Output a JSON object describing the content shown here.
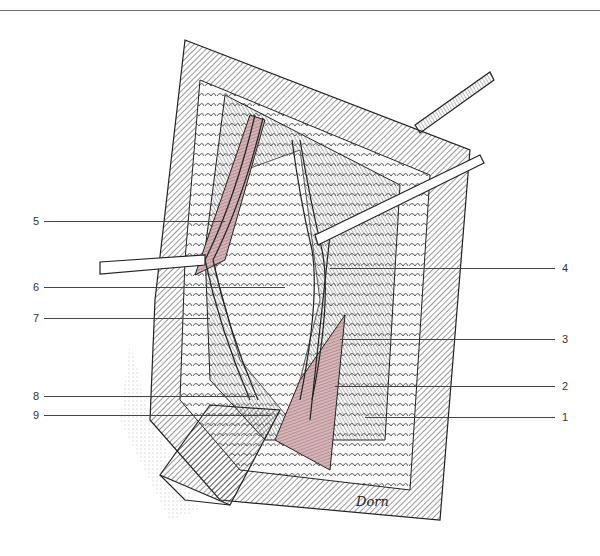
{
  "figure": {
    "signature": "Dorn",
    "colors": {
      "ink": "#1e1e1e",
      "muscle": "#c9a3a6",
      "background": "#ffffff",
      "rule": "#6d6d6d"
    },
    "labels_left": [
      {
        "num": "5",
        "y": 221,
        "x_end": 225
      },
      {
        "num": "6",
        "y": 287,
        "x_end": 285
      },
      {
        "num": "7",
        "y": 318,
        "x_end": 210
      },
      {
        "num": "8",
        "y": 396,
        "x_end": 255
      },
      {
        "num": "9",
        "y": 415,
        "x_end": 270
      }
    ],
    "labels_right": [
      {
        "num": "4",
        "y": 268,
        "x_start": 330
      },
      {
        "num": "3",
        "y": 339,
        "x_start": 340
      },
      {
        "num": "2",
        "y": 386,
        "x_start": 335
      },
      {
        "num": "1",
        "y": 417,
        "x_start": 365
      }
    ]
  }
}
